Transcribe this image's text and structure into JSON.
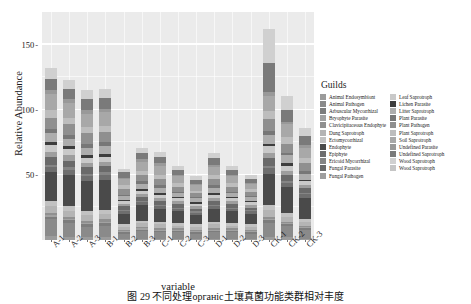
{
  "chart_data": {
    "type": "bar",
    "stacked": true,
    "title": "",
    "xlabel": "variable",
    "ylabel": "Relative Abundance",
    "ylim": [
      0,
      175
    ],
    "yticks": [
      50,
      100,
      150
    ],
    "ytick_labels": [
      "50",
      "100",
      "150"
    ],
    "grid": true,
    "legend_title": "Guilds",
    "legend_position": "right",
    "categories": [
      "A-1",
      "A-2",
      "A-3",
      "B-1",
      "B-2",
      "B-3",
      "C-1",
      "C-2",
      "C-3",
      "D-1",
      "D-2",
      "D-3",
      "CK-1",
      "CK-2",
      "CK-3"
    ],
    "series": [
      {
        "name": "Animal Endosymbiont",
        "color": "#9b9b9b",
        "values": [
          3,
          2,
          2,
          2,
          1,
          1,
          1,
          1,
          1,
          1,
          1,
          1,
          2,
          2,
          1
        ]
      },
      {
        "name": "Animal Pathogen",
        "color": "#8a8a8a",
        "values": [
          13,
          11,
          8,
          9,
          4,
          6,
          5,
          5,
          4,
          5,
          5,
          4,
          11,
          9,
          7
        ]
      },
      {
        "name": "Arbuscular Mycorrhizal",
        "color": "#7d7d7d",
        "values": [
          2,
          2,
          2,
          2,
          1,
          1,
          1,
          1,
          1,
          1,
          1,
          1,
          2,
          1,
          1
        ]
      },
      {
        "name": "Bryophyte Parasite",
        "color": "#a2a2a2",
        "values": [
          1,
          1,
          1,
          1,
          1,
          1,
          1,
          1,
          1,
          1,
          1,
          1,
          1,
          1,
          1
        ]
      },
      {
        "name": "Clavicipitaceous Endophyte",
        "color": "#909090",
        "values": [
          2,
          2,
          2,
          2,
          1,
          1,
          1,
          1,
          1,
          1,
          1,
          1,
          2,
          1,
          1
        ]
      },
      {
        "name": "Dung Saprotroph",
        "color": "#b4b4b4",
        "values": [
          5,
          4,
          4,
          4,
          2,
          3,
          3,
          2,
          2,
          3,
          2,
          2,
          5,
          4,
          3
        ]
      },
      {
        "name": "Ectomycorrhizal",
        "color": "#c2c2c2",
        "values": [
          4,
          4,
          3,
          3,
          2,
          2,
          2,
          2,
          2,
          2,
          2,
          2,
          4,
          3,
          2
        ]
      },
      {
        "name": "Endophyte",
        "color": "#4a4a4a",
        "values": [
          22,
          24,
          23,
          23,
          8,
          12,
          10,
          9,
          7,
          10,
          9,
          8,
          24,
          20,
          16
        ]
      },
      {
        "name": "Epiphyte",
        "color": "#6e6e6e",
        "values": [
          4,
          4,
          4,
          4,
          2,
          2,
          2,
          2,
          2,
          2,
          2,
          2,
          4,
          3,
          3
        ]
      },
      {
        "name": "Ericoid Mycorrhizal",
        "color": "#858585",
        "values": [
          2,
          2,
          2,
          2,
          1,
          1,
          1,
          1,
          1,
          1,
          1,
          1,
          2,
          1,
          1
        ]
      },
      {
        "name": "Fungal Parasite",
        "color": "#6a6a6a",
        "values": [
          6,
          5,
          5,
          5,
          3,
          3,
          3,
          3,
          2,
          3,
          3,
          2,
          6,
          5,
          4
        ]
      },
      {
        "name": "Fungal Pathogen",
        "color": "#9e9e9e",
        "values": [
          4,
          4,
          3,
          3,
          2,
          2,
          2,
          2,
          2,
          2,
          2,
          2,
          4,
          3,
          2
        ]
      },
      {
        "name": "Leaf Saprotroph",
        "color": "#c9c9c9",
        "values": [
          5,
          5,
          4,
          4,
          2,
          3,
          3,
          2,
          2,
          3,
          2,
          2,
          5,
          4,
          3
        ]
      },
      {
        "name": "Lichen Parasite",
        "color": "#3d3d3d",
        "values": [
          2,
          2,
          2,
          2,
          1,
          1,
          1,
          1,
          1,
          1,
          1,
          1,
          2,
          2,
          1
        ]
      },
      {
        "name": "Litter Saprotroph",
        "color": "#adadad",
        "values": [
          7,
          6,
          6,
          6,
          3,
          4,
          4,
          3,
          3,
          4,
          3,
          3,
          7,
          6,
          5
        ]
      },
      {
        "name": "Plant Parasite",
        "color": "#777777",
        "values": [
          3,
          3,
          3,
          3,
          1,
          2,
          2,
          1,
          1,
          2,
          1,
          1,
          3,
          2,
          2
        ]
      },
      {
        "name": "Plant Pathogen",
        "color": "#8f8f8f",
        "values": [
          9,
          8,
          8,
          8,
          4,
          5,
          5,
          4,
          3,
          5,
          4,
          3,
          9,
          7,
          6
        ]
      },
      {
        "name": "Plant Saprotroph",
        "color": "#bdbdbd",
        "values": [
          6,
          5,
          5,
          5,
          3,
          3,
          3,
          3,
          2,
          3,
          3,
          2,
          6,
          5,
          4
        ]
      },
      {
        "name": "Soil Saprotroph",
        "color": "#a8a8a8",
        "values": [
          12,
          11,
          10,
          10,
          5,
          7,
          7,
          5,
          4,
          6,
          5,
          4,
          12,
          10,
          8
        ]
      },
      {
        "name": "Undefined Parasite",
        "color": "#999999",
        "values": [
          3,
          3,
          3,
          3,
          1,
          2,
          2,
          1,
          1,
          2,
          1,
          1,
          3,
          2,
          2
        ]
      },
      {
        "name": "Undefined Saprotroph",
        "color": "#7a7a7a",
        "values": [
          9,
          8,
          8,
          8,
          4,
          5,
          5,
          4,
          3,
          5,
          4,
          3,
          22,
          9,
          7
        ]
      },
      {
        "name": "Wood Saprotroph",
        "color": "#d0d0d0",
        "values": [
          8,
          7,
          7,
          7,
          3,
          4,
          4,
          3,
          3,
          4,
          3,
          3,
          26,
          11,
          6
        ]
      }
    ]
  },
  "axes": {
    "y_label": "Relative Abundance",
    "x_label": "variable",
    "y_ticks": [
      "50",
      "100",
      "150"
    ]
  },
  "legend": {
    "title": "Guilds",
    "column_1": [
      {
        "label": "Animal Endosymbiont",
        "color": "#9b9b9b"
      },
      {
        "label": "Animal Pathogen",
        "color": "#8a8a8a"
      },
      {
        "label": "Arbuscular Mycorrhizal",
        "color": "#7d7d7d"
      },
      {
        "label": "Bryophyte Parasite",
        "color": "#a2a2a2"
      },
      {
        "label": "Clavicipitaceous Endophyte",
        "color": "#909090"
      },
      {
        "label": "Dung Saprotroph",
        "color": "#b4b4b4"
      },
      {
        "label": "Ectomycorrhizal",
        "color": "#c2c2c2"
      },
      {
        "label": "Endophyte",
        "color": "#4a4a4a"
      },
      {
        "label": "Epiphyte",
        "color": "#6e6e6e"
      },
      {
        "label": "Ericoid Mycorrhizal",
        "color": "#858585"
      },
      {
        "label": "Fungal Parasite",
        "color": "#6a6a6a"
      },
      {
        "label": "Fungal Pathogen",
        "color": "#9e9e9e"
      }
    ],
    "column_2": [
      {
        "label": "Leaf Saprotroph",
        "color": "#c9c9c9"
      },
      {
        "label": "Lichen Parasite",
        "color": "#3d3d3d"
      },
      {
        "label": "Litter Saprotroph",
        "color": "#adadad"
      },
      {
        "label": "Plant Parasite",
        "color": "#777777"
      },
      {
        "label": "Plant Pathogen",
        "color": "#8f8f8f"
      },
      {
        "label": "Plant Saprotroph",
        "color": "#bdbdbd"
      },
      {
        "label": "Soil Saprotroph",
        "color": "#a8a8a8"
      },
      {
        "label": "Undefined Parasite",
        "color": "#999999"
      },
      {
        "label": "Undefined Saprotroph",
        "color": "#7a7a7a"
      },
      {
        "label": "Wood Saprotroph",
        "color": "#d0d0d0"
      },
      {
        "label": "Wood Saprotroph",
        "color": "#c5c5c5"
      }
    ]
  },
  "caption": "图 29   不同处理органic土壤真菌功能类群相对丰度"
}
